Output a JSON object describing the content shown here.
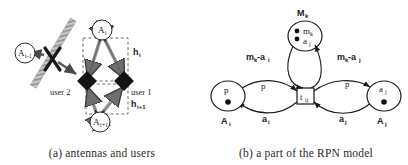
{
  "figure": {
    "panels": [
      {
        "id": "a",
        "caption": "(a) antennas and users",
        "nodes": [
          {
            "name": "antenna-left",
            "label": "A",
            "sub": "i-1"
          },
          {
            "name": "antenna-top",
            "label": "A",
            "sub": "i"
          },
          {
            "name": "antenna-bottom",
            "label": "A",
            "sub": "i+1"
          }
        ],
        "users": [
          {
            "name": "user-2",
            "label": "user 2"
          },
          {
            "name": "user-1",
            "label": "user 1"
          }
        ],
        "channels": [
          {
            "name": "channel-hi",
            "label": "h",
            "sub": "i"
          },
          {
            "name": "channel-hi1",
            "label": "h",
            "sub": "i+1"
          }
        ]
      },
      {
        "id": "b",
        "caption": "(b) a part of the RPN model",
        "places": [
          {
            "name": "place-Ai",
            "inner": "p",
            "inner_sub": "",
            "tokens": 1,
            "label": "A",
            "label_sub": "i"
          },
          {
            "name": "place-Aj",
            "inner": "a",
            "inner_sub": "j",
            "tokens": 1,
            "label": "A",
            "label_sub": "j"
          },
          {
            "name": "place-Mk",
            "inner_top": "m",
            "inner_top_sub": "k",
            "inner_bot": "a",
            "inner_bot_sub": "j",
            "tokens": 2,
            "label": "M",
            "label_sub": "k"
          }
        ],
        "transition": {
          "name": "transition-tij",
          "label": "t",
          "sub": "ij"
        },
        "arcs": [
          {
            "name": "arc-label-p-left",
            "label": "p",
            "sub": ""
          },
          {
            "name": "arc-label-p-right",
            "label": "p",
            "sub": ""
          },
          {
            "name": "arc-label-ai",
            "label": "a",
            "sub": "i"
          },
          {
            "name": "arc-label-aj",
            "label": "a",
            "sub": "j"
          },
          {
            "name": "arc-label-mk-ai",
            "label": "m",
            "sub": "k",
            "label2": "-a",
            "sub2": "i"
          },
          {
            "name": "arc-label-mk-aj",
            "label": "m",
            "sub": "k",
            "label2": "-a",
            "sub2": "j"
          }
        ]
      }
    ]
  },
  "colors": {
    "ink": "#1a1a1a",
    "arrow_fill": "#8a8a8a",
    "arrow_stroke": "#3a3a3a",
    "hatch": "#b0b0b0",
    "dash": "#555555"
  }
}
